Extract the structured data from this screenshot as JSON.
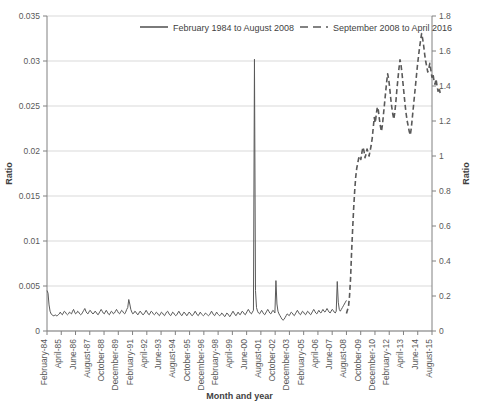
{
  "chart_data": {
    "type": "line",
    "title": "",
    "xlabel": "Month and year",
    "ylabel": "Ratio",
    "ylabel_right": "Ratio",
    "grid": true,
    "legend_position": "top-center",
    "ylim": [
      0,
      0.035
    ],
    "ylim_right": [
      0,
      1.8
    ],
    "ytick_labels": [
      "0",
      "0.005",
      "0.01",
      "0.015",
      "0.02",
      "0.025",
      "0.03",
      "0.035"
    ],
    "ytick_values": [
      0,
      0.005,
      0.01,
      0.015,
      0.02,
      0.025,
      0.03,
      0.035
    ],
    "ytick_labels_right": [
      "0",
      "0.2",
      "0.4",
      "0.6",
      "0.8",
      "1",
      "1.2",
      "1.4",
      "1.6",
      "1.8"
    ],
    "ytick_values_right": [
      0,
      0.2,
      0.4,
      0.6,
      0.8,
      1.0,
      1.2,
      1.4,
      1.6,
      1.8
    ],
    "xtick_labels": [
      "February-84",
      "April-85",
      "June-86",
      "August-87",
      "October-88",
      "December-89",
      "February-91",
      "April-92",
      "June-93",
      "August-94",
      "October-95",
      "December-96",
      "February-98",
      "April-99",
      "June-00",
      "August-01",
      "October-02",
      "December-03",
      "February-05",
      "April-06",
      "June-07",
      "August-08",
      "October-09",
      "December-10",
      "February-12",
      "April-13",
      "June-14",
      "August-15"
    ],
    "colors": {
      "series1": "#595959",
      "series2": "#595959",
      "grid": "#d9d9d9",
      "axis": "#808080"
    },
    "series": [
      {
        "name": "February 1984 to August 2008",
        "style": "solid",
        "axis": "left",
        "x_start_index": 0,
        "x_end_index": 294,
        "values": [
          0.0045,
          0.0042,
          0.0029,
          0.0022,
          0.0019,
          0.0018,
          0.0017,
          0.0017,
          0.0018,
          0.0017,
          0.0017,
          0.0018,
          0.0019,
          0.0021,
          0.0019,
          0.0018,
          0.002,
          0.0022,
          0.0021,
          0.0019,
          0.0018,
          0.0019,
          0.0021,
          0.002,
          0.0019,
          0.0022,
          0.0024,
          0.0021,
          0.0019,
          0.002,
          0.0022,
          0.0021,
          0.0019,
          0.0018,
          0.0019,
          0.0021,
          0.0023,
          0.0025,
          0.0022,
          0.002,
          0.0019,
          0.0021,
          0.0023,
          0.0022,
          0.002,
          0.0019,
          0.002,
          0.0022,
          0.0021,
          0.0019,
          0.0018,
          0.002,
          0.0022,
          0.0024,
          0.0022,
          0.002,
          0.0019,
          0.0021,
          0.0023,
          0.0021,
          0.0019,
          0.0018,
          0.002,
          0.0022,
          0.0021,
          0.0019,
          0.002,
          0.0022,
          0.0024,
          0.0022,
          0.002,
          0.0019,
          0.0021,
          0.0023,
          0.0022,
          0.002,
          0.0019,
          0.0021,
          0.0024,
          0.0026,
          0.0035,
          0.003,
          0.0024,
          0.0021,
          0.0019,
          0.002,
          0.0022,
          0.0021,
          0.0019,
          0.0018,
          0.002,
          0.0022,
          0.0021,
          0.0019,
          0.0018,
          0.0019,
          0.0021,
          0.0023,
          0.0021,
          0.0019,
          0.0018,
          0.002,
          0.0022,
          0.0021,
          0.0019,
          0.0018,
          0.0019,
          0.0021,
          0.002,
          0.0018,
          0.0017,
          0.0019,
          0.0021,
          0.002,
          0.0018,
          0.0017,
          0.0019,
          0.0021,
          0.0022,
          0.002,
          0.0018,
          0.0017,
          0.0019,
          0.0021,
          0.002,
          0.0018,
          0.0017,
          0.0018,
          0.002,
          0.0022,
          0.002,
          0.0018,
          0.0017,
          0.0019,
          0.0021,
          0.002,
          0.0018,
          0.0017,
          0.0019,
          0.0021,
          0.002,
          0.0018,
          0.0017,
          0.0018,
          0.002,
          0.0022,
          0.002,
          0.0018,
          0.0017,
          0.0019,
          0.0021,
          0.0019,
          0.0018,
          0.0017,
          0.0018,
          0.002,
          0.0019,
          0.0018,
          0.0017,
          0.0018,
          0.002,
          0.0022,
          0.002,
          0.0018,
          0.0017,
          0.0019,
          0.0021,
          0.0019,
          0.0018,
          0.0017,
          0.0018,
          0.002,
          0.0019,
          0.0017,
          0.0016,
          0.0018,
          0.002,
          0.0019,
          0.0017,
          0.0016,
          0.0018,
          0.002,
          0.0022,
          0.002,
          0.0018,
          0.0017,
          0.0019,
          0.0021,
          0.0019,
          0.0018,
          0.002,
          0.0022,
          0.0021,
          0.0019,
          0.0018,
          0.002,
          0.0022,
          0.0024,
          0.0022,
          0.002,
          0.0019,
          0.0021,
          0.0023,
          0.0302,
          0.0045,
          0.0026,
          0.0022,
          0.002,
          0.0019,
          0.0021,
          0.0023,
          0.0021,
          0.0019,
          0.0018,
          0.002,
          0.0022,
          0.0024,
          0.0022,
          0.002,
          0.0019,
          0.0021,
          0.0023,
          0.0022,
          0.002,
          0.0056,
          0.003,
          0.0022,
          0.0019,
          0.0017,
          0.0015,
          0.0013,
          0.0012,
          0.0013,
          0.0015,
          0.0017,
          0.0019,
          0.0018,
          0.0017,
          0.0019,
          0.0021,
          0.002,
          0.0018,
          0.0017,
          0.0019,
          0.0021,
          0.0023,
          0.0021,
          0.0019,
          0.0018,
          0.002,
          0.0022,
          0.0021,
          0.0019,
          0.0018,
          0.002,
          0.0022,
          0.0021,
          0.0019,
          0.0018,
          0.002,
          0.0022,
          0.0024,
          0.0022,
          0.002,
          0.0019,
          0.0021,
          0.0023,
          0.0021,
          0.002,
          0.0022,
          0.0024,
          0.0022,
          0.0021,
          0.0023,
          0.0025,
          0.0023,
          0.0021,
          0.002,
          0.0022,
          0.0024,
          0.0023,
          0.0021,
          0.002,
          0.0022,
          0.0055,
          0.0032,
          0.0024,
          0.0022,
          0.0024,
          0.0026,
          0.0028,
          0.003,
          0.0032,
          0.0034
        ]
      },
      {
        "name": "September 2008 to April 2016",
        "style": "dashed",
        "axis": "right",
        "x_start_index": 294,
        "x_end_index": 386,
        "values": [
          0.1,
          0.12,
          0.14,
          0.2,
          0.3,
          0.45,
          0.58,
          0.7,
          0.8,
          0.88,
          0.93,
          0.96,
          0.99,
          1.0,
          0.98,
          1.02,
          1.05,
          1.03,
          0.99,
          1.01,
          1.04,
          1.02,
          1.0,
          1.03,
          1.06,
          1.1,
          1.16,
          1.22,
          1.19,
          1.24,
          1.28,
          1.26,
          1.21,
          1.17,
          1.14,
          1.18,
          1.24,
          1.3,
          1.36,
          1.42,
          1.47,
          1.44,
          1.39,
          1.33,
          1.28,
          1.24,
          1.21,
          1.25,
          1.31,
          1.38,
          1.44,
          1.5,
          1.55,
          1.52,
          1.47,
          1.41,
          1.35,
          1.29,
          1.24,
          1.2,
          1.17,
          1.14,
          1.12,
          1.16,
          1.22,
          1.28,
          1.34,
          1.4,
          1.46,
          1.52,
          1.57,
          1.62,
          1.66,
          1.7,
          1.67,
          1.63,
          1.58,
          1.54,
          1.51,
          1.48,
          1.5,
          1.53,
          1.49,
          1.45,
          1.47,
          1.43,
          1.41,
          1.44,
          1.4,
          1.37,
          1.39,
          1.36
        ]
      }
    ]
  },
  "legend": {
    "items": [
      {
        "label": "February 1984 to August 2008",
        "style": "solid"
      },
      {
        "label": "September 2008 to April 2016",
        "style": "dashed"
      }
    ]
  },
  "axes": {
    "left_title": "Ratio",
    "right_title": "Ratio",
    "bottom_title": "Month and year"
  }
}
